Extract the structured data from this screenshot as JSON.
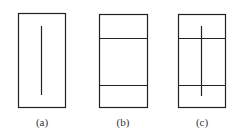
{
  "figure": {
    "stroke_color": "#222222",
    "panels": [
      {
        "id": "a",
        "label": "(a)",
        "box": {
          "x": 18,
          "y": 13,
          "w": 47,
          "h": 94
        },
        "hlines": [],
        "vline": {
          "x": 41,
          "y1": 26,
          "y2": 95
        }
      },
      {
        "id": "b",
        "label": "(b)",
        "box": {
          "x": 99,
          "y": 14,
          "w": 48,
          "h": 93
        },
        "hlines": [
          38,
          85
        ],
        "vline": null
      },
      {
        "id": "c",
        "label": "(c)",
        "box": {
          "x": 178,
          "y": 14,
          "w": 47,
          "h": 93
        },
        "hlines": [
          38,
          85
        ],
        "vline": {
          "x": 201,
          "y1": 26,
          "y2": 96
        }
      }
    ]
  }
}
